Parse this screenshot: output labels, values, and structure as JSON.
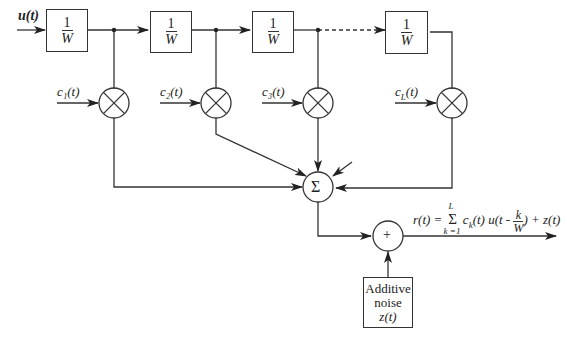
{
  "diagram": {
    "type": "tapped-delay-line channel model",
    "input": {
      "label": "u(t)"
    },
    "delays": [
      {
        "id": "delay-1",
        "num": "1",
        "den": "W"
      },
      {
        "id": "delay-2",
        "num": "1",
        "den": "W"
      },
      {
        "id": "delay-3",
        "num": "1",
        "den": "W"
      },
      {
        "id": "delay-L",
        "num": "1",
        "den": "W"
      }
    ],
    "tap_coefficients": [
      {
        "id": "c1",
        "label": "c₁(t)"
      },
      {
        "id": "c2",
        "label": "c₂(t)"
      },
      {
        "id": "c3",
        "label": "c₃(t)"
      },
      {
        "id": "cL",
        "label": "c_L(t)"
      }
    ],
    "multiplier_symbol": "⊗",
    "summer": {
      "symbol": "Σ"
    },
    "adder": {
      "symbol": "+"
    },
    "noise_block": {
      "line1": "Additive",
      "line2": "noise",
      "line3": "z(t)"
    },
    "output_equation": {
      "lhs": "r(t) =",
      "sum_upper": "L",
      "sum_lower": "k =1",
      "sum_symbol": "Σ",
      "term": "c",
      "term_sub": "k",
      "term2": "(t) u(t -",
      "frac_num": "k",
      "frac_den": "W",
      "tail": ") + z(t)"
    }
  }
}
